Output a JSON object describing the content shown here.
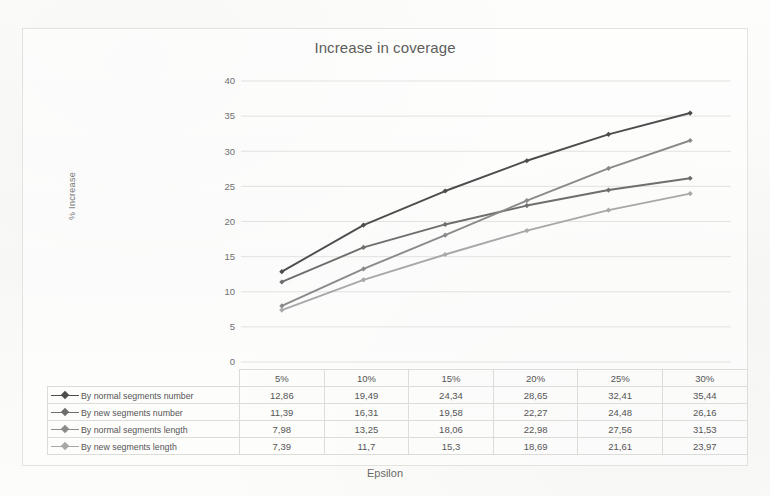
{
  "chart_data": {
    "type": "line",
    "title": "Increase in coverage",
    "xlabel": "Epsilon",
    "ylabel": "% Increase",
    "categories": [
      "5%",
      "10%",
      "15%",
      "20%",
      "25%",
      "30%"
    ],
    "ylim": [
      0,
      40
    ],
    "yticks": [
      "0",
      "5",
      "10",
      "15",
      "20",
      "25",
      "30",
      "35",
      "40"
    ],
    "grid": true,
    "legend_position": "data-table-left",
    "series": [
      {
        "name": "By normal segments number",
        "color": "#4d4d4d",
        "values": [
          12.86,
          19.49,
          24.34,
          28.65,
          32.41,
          35.44
        ],
        "labels": [
          "12,86",
          "19,49",
          "24,34",
          "28,65",
          "32,41",
          "35,44"
        ]
      },
      {
        "name": "By new segments number",
        "color": "#6e6e6e",
        "values": [
          11.39,
          16.31,
          19.58,
          22.27,
          24.48,
          26.16
        ],
        "labels": [
          "11,39",
          "16,31",
          "19,58",
          "22,27",
          "24,48",
          "26,16"
        ]
      },
      {
        "name": "By normal segments length",
        "color": "#8a8a8a",
        "values": [
          7.98,
          13.25,
          18.06,
          22.98,
          27.56,
          31.53
        ],
        "labels": [
          "7,98",
          "13,25",
          "18,06",
          "22,98",
          "27,56",
          "31,53"
        ]
      },
      {
        "name": "By new segments length",
        "color": "#a8a8a8",
        "values": [
          7.39,
          11.7,
          15.3,
          18.69,
          21.61,
          23.97
        ],
        "labels": [
          "7,39",
          "11,7",
          "15,3",
          "18,69",
          "21,61",
          "23,97"
        ]
      }
    ]
  }
}
